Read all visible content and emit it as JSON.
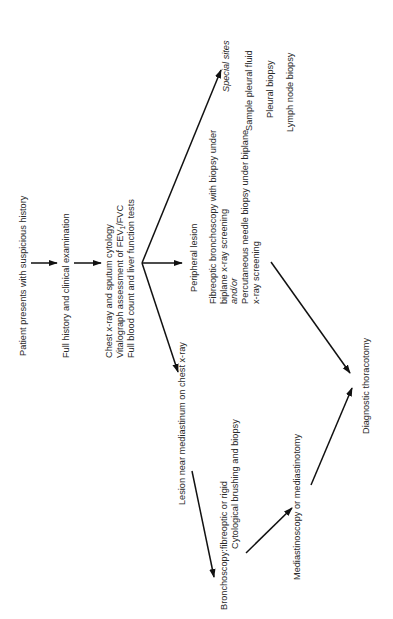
{
  "diagram": {
    "orientation": "rotated 90 degrees counter-clockwise",
    "nodes": {
      "patient": "Patient presents with suspicious history",
      "history": "Full history and clinical examination",
      "tests": [
        "Chest x-ray and sputum cytology",
        "Vitalograph assessment of FEV",
        "Full blood count and liver function tests"
      ],
      "tests_fev_sub": "1",
      "tests_fev_tail": "/FVC",
      "peripheral": "Peripheral lesion",
      "peripheral_options": [
        "Fibreoptic bronchoscopy with biopsy under",
        "biplane x-ray screening",
        "and/or",
        "Percutaneous needle biopsy under biplane",
        "x-ray screening"
      ],
      "special_title": "Special sites",
      "special_items": [
        "Sample pleural fluid",
        "Pleural biopsy",
        "Lymph node biopsy"
      ],
      "mediastinum": "Lesion near mediastinum on chest x-ray",
      "bronchoscopy_label": "Bronchoscopy:",
      "bronchoscopy_lines": [
        "fibreoptic or rigid",
        "Cytological brushing and biopsy"
      ],
      "mediastinoscopy": "Mediastinoscopy or mediastinotomy",
      "thoracotomy": "Diagnostic thoracotomy"
    },
    "edges": [
      [
        "patient",
        "history"
      ],
      [
        "history",
        "tests"
      ],
      [
        "tests",
        "peripheral"
      ],
      [
        "tests",
        "mediastinum"
      ],
      [
        "tests",
        "special_title"
      ],
      [
        "mediastinum",
        "bronchoscopy_label"
      ],
      [
        "bronchoscopy_label",
        "mediastinoscopy"
      ],
      [
        "mediastinoscopy",
        "thoracotomy"
      ],
      [
        "peripheral_options",
        "thoracotomy"
      ]
    ]
  }
}
